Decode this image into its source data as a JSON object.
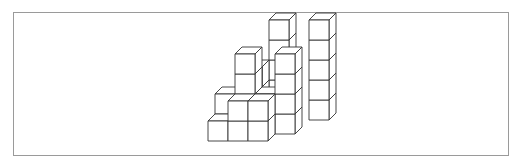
{
  "figure": {
    "line_color": "#333333",
    "frame_color": "#9a9a9a",
    "cubes": [
      {
        "x": 0,
        "y": 0,
        "z": 0
      },
      {
        "x": 1,
        "y": 0,
        "z": 0
      },
      {
        "x": 2,
        "y": 0,
        "z": 0
      },
      {
        "x": 1,
        "y": 0,
        "z": 1
      },
      {
        "x": 2,
        "y": 0,
        "z": 1
      },
      {
        "x": 0,
        "y": 1,
        "z": 0
      },
      {
        "x": 0,
        "y": 1,
        "z": 1
      },
      {
        "x": 1,
        "y": 1,
        "z": 0
      },
      {
        "x": 1,
        "y": 1,
        "z": 1
      },
      {
        "x": 1,
        "y": 1,
        "z": 2
      },
      {
        "x": 1,
        "y": 1,
        "z": 3
      },
      {
        "x": 2,
        "y": 1,
        "z": 0
      },
      {
        "x": 2,
        "y": 1,
        "z": 1
      },
      {
        "x": 3,
        "y": 1,
        "z": 0
      },
      {
        "x": 3,
        "y": 1,
        "z": 1
      },
      {
        "x": 3,
        "y": 1,
        "z": 2
      },
      {
        "x": 3,
        "y": 1,
        "z": 3
      },
      {
        "x": 1,
        "y": 2,
        "z": 0
      },
      {
        "x": 1,
        "y": 2,
        "z": 1
      },
      {
        "x": 1,
        "y": 2,
        "z": 2
      },
      {
        "x": 2,
        "y": 3,
        "z": 0
      },
      {
        "x": 2,
        "y": 3,
        "z": 1
      },
      {
        "x": 2,
        "y": 3,
        "z": 2
      },
      {
        "x": 2,
        "y": 3,
        "z": 3
      },
      {
        "x": 2,
        "y": 3,
        "z": 4
      },
      {
        "x": 4,
        "y": 3,
        "z": 0
      },
      {
        "x": 4,
        "y": 3,
        "z": 1
      },
      {
        "x": 4,
        "y": 3,
        "z": 2
      },
      {
        "x": 4,
        "y": 3,
        "z": 3
      },
      {
        "x": 4,
        "y": 3,
        "z": 4
      }
    ]
  }
}
